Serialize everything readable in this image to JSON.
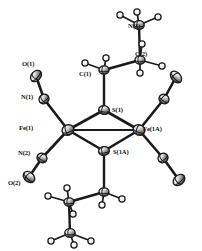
{
  "figure": {
    "kind": "ortep-thermal-ellipsoid-plot",
    "title": "",
    "background_color": "#ffffff",
    "line_color": "#1a1a1a",
    "ellipsoid_fill": "#d9d9d9",
    "ellipsoid_dark": "#3a3a3a",
    "hydrogen_fill": "#fbfbfb",
    "width": 202,
    "height": 251
  },
  "labels": [
    {
      "id": "label-n3",
      "text": "N(3)",
      "x": 128,
      "y": 28
    },
    {
      "id": "label-c2",
      "text": "C(2)",
      "x": 135,
      "y": 56
    },
    {
      "id": "label-c1",
      "text": "C(1)",
      "x": 79,
      "y": 76
    },
    {
      "id": "label-o1",
      "text": "O(1)",
      "x": 22,
      "y": 66
    },
    {
      "id": "label-n1",
      "text": "N(1)",
      "x": 21,
      "y": 99
    },
    {
      "id": "label-fe1",
      "text": "Fe(1)",
      "x": 19,
      "y": 130
    },
    {
      "id": "label-n2",
      "text": "N(2)",
      "x": 18,
      "y": 155
    },
    {
      "id": "label-o2",
      "text": "O(2)",
      "x": 8,
      "y": 185
    },
    {
      "id": "label-s1",
      "text": "S(1)",
      "x": 112,
      "y": 112
    },
    {
      "id": "label-s1a",
      "text": "S(1A)",
      "x": 113,
      "y": 154
    },
    {
      "id": "label-fe1a",
      "text": "Fe(1A)",
      "x": 143,
      "y": 131
    }
  ],
  "atoms": [
    {
      "id": "atom-fe1",
      "element": "Fe",
      "label": "Fe(1)",
      "x": 68,
      "y": 130,
      "rx": 6.0,
      "ry": 5.2,
      "rot": -18,
      "kind": "ellipsoid"
    },
    {
      "id": "atom-fe1a",
      "element": "Fe",
      "label": "Fe(1A)",
      "x": 139,
      "y": 130,
      "rx": 6.0,
      "ry": 5.2,
      "rot": 18,
      "kind": "ellipsoid"
    },
    {
      "id": "atom-s1",
      "element": "S",
      "label": "S(1)",
      "x": 104,
      "y": 110,
      "rx": 5.4,
      "ry": 4.4,
      "rot": 8,
      "kind": "ellipsoid"
    },
    {
      "id": "atom-s1a",
      "element": "S",
      "label": "S(1A)",
      "x": 104,
      "y": 151,
      "rx": 5.4,
      "ry": 4.4,
      "rot": -8,
      "kind": "ellipsoid"
    },
    {
      "id": "atom-n1",
      "element": "N",
      "label": "N(1)",
      "x": 44,
      "y": 99,
      "rx": 5.2,
      "ry": 4.6,
      "rot": -35,
      "kind": "ellipsoid"
    },
    {
      "id": "atom-o1",
      "element": "O",
      "label": "O(1)",
      "x": 36,
      "y": 76,
      "rx": 6.4,
      "ry": 4.6,
      "rot": -48,
      "kind": "ellipsoid"
    },
    {
      "id": "atom-n2",
      "element": "N",
      "label": "N(2)",
      "x": 42,
      "y": 158,
      "rx": 5.2,
      "ry": 4.6,
      "rot": 35,
      "kind": "ellipsoid"
    },
    {
      "id": "atom-o2",
      "element": "O",
      "label": "O(2)",
      "x": 29,
      "y": 177,
      "rx": 6.4,
      "ry": 4.8,
      "rot": 42,
      "kind": "ellipsoid"
    },
    {
      "id": "atom-n1a",
      "element": "N",
      "label": "",
      "x": 164,
      "y": 99,
      "rx": 5.2,
      "ry": 4.6,
      "rot": 35,
      "kind": "ellipsoid"
    },
    {
      "id": "atom-o1a",
      "element": "O",
      "label": "",
      "x": 176,
      "y": 77,
      "rx": 6.6,
      "ry": 4.6,
      "rot": 48,
      "kind": "ellipsoid"
    },
    {
      "id": "atom-n2a",
      "element": "N",
      "label": "",
      "x": 163,
      "y": 158,
      "rx": 5.2,
      "ry": 4.6,
      "rot": -35,
      "kind": "ellipsoid"
    },
    {
      "id": "atom-o2a",
      "element": "O",
      "label": "",
      "x": 179,
      "y": 180,
      "rx": 6.6,
      "ry": 4.8,
      "rot": -42,
      "kind": "ellipsoid"
    },
    {
      "id": "atom-c1",
      "element": "C",
      "label": "C(1)",
      "x": 104,
      "y": 70,
      "rx": 5.0,
      "ry": 4.2,
      "rot": 0,
      "kind": "ellipsoid"
    },
    {
      "id": "atom-c2",
      "element": "C",
      "label": "C(2)",
      "x": 140,
      "y": 60,
      "rx": 5.0,
      "ry": 4.2,
      "rot": 0,
      "kind": "ellipsoid"
    },
    {
      "id": "atom-n3",
      "element": "N",
      "label": "N(3)",
      "x": 139,
      "y": 25,
      "rx": 5.2,
      "ry": 4.4,
      "rot": 0,
      "kind": "ellipsoid"
    },
    {
      "id": "atom-c1a",
      "element": "C",
      "label": "",
      "x": 104,
      "y": 192,
      "rx": 5.0,
      "ry": 4.2,
      "rot": 0,
      "kind": "ellipsoid"
    },
    {
      "id": "atom-c2a",
      "element": "C",
      "label": "",
      "x": 69,
      "y": 202,
      "rx": 5.0,
      "ry": 4.2,
      "rot": 0,
      "kind": "ellipsoid"
    },
    {
      "id": "atom-n3a",
      "element": "N",
      "label": "",
      "x": 70,
      "y": 233,
      "rx": 5.2,
      "ry": 4.4,
      "rot": 0,
      "kind": "ellipsoid"
    }
  ],
  "hydrogens": [
    {
      "id": "h-n3-a",
      "x": 120,
      "y": 15,
      "r": 3.1
    },
    {
      "id": "h-n3-b",
      "x": 137,
      "y": 12,
      "r": 3.1
    },
    {
      "id": "h-n3-c",
      "x": 158,
      "y": 17,
      "r": 3.1
    },
    {
      "id": "h-c2-a",
      "x": 142,
      "y": 44,
      "r": 3.1
    },
    {
      "id": "h-c2-b",
      "x": 162,
      "y": 66,
      "r": 3.1
    },
    {
      "id": "h-c2-c",
      "x": 140,
      "y": 73,
      "r": 3.1
    },
    {
      "id": "h-c1-a",
      "x": 85,
      "y": 63,
      "r": 3.1
    },
    {
      "id": "h-c1-b",
      "x": 106,
      "y": 58,
      "r": 3.1
    },
    {
      "id": "h-c1a-a",
      "x": 122,
      "y": 199,
      "r": 3.1
    },
    {
      "id": "h-c1a-b",
      "x": 102,
      "y": 205,
      "r": 3.1
    },
    {
      "id": "h-c2a-a",
      "x": 67,
      "y": 188,
      "r": 3.1
    },
    {
      "id": "h-c2a-b",
      "x": 48,
      "y": 196,
      "r": 3.1
    },
    {
      "id": "h-c2a-c",
      "x": 73,
      "y": 214,
      "r": 3.1
    },
    {
      "id": "h-n3a-a",
      "x": 51,
      "y": 241,
      "r": 3.1
    },
    {
      "id": "h-n3a-b",
      "x": 74,
      "y": 245,
      "r": 3.1
    },
    {
      "id": "h-n3a-c",
      "x": 91,
      "y": 241,
      "r": 3.1
    }
  ],
  "bonds": [
    {
      "id": "bond-fe1-s1",
      "from": "atom-fe1",
      "to": "atom-s1",
      "width": 2.6
    },
    {
      "id": "bond-fe1-s1a",
      "from": "atom-fe1",
      "to": "atom-s1a",
      "width": 2.6
    },
    {
      "id": "bond-fe1a-s1",
      "from": "atom-fe1a",
      "to": "atom-s1",
      "width": 2.6
    },
    {
      "id": "bond-fe1a-s1a",
      "from": "atom-fe1a",
      "to": "atom-s1a",
      "width": 2.6
    },
    {
      "id": "bond-fe1-fe1a",
      "from": "atom-fe1",
      "to": "atom-fe1a",
      "width": 1.9
    },
    {
      "id": "bond-fe1-n1",
      "from": "atom-fe1",
      "to": "atom-n1",
      "width": 2.6
    },
    {
      "id": "bond-n1-o1",
      "from": "atom-n1",
      "to": "atom-o1",
      "width": 2.6
    },
    {
      "id": "bond-fe1-n2",
      "from": "atom-fe1",
      "to": "atom-n2",
      "width": 2.6
    },
    {
      "id": "bond-n2-o2",
      "from": "atom-n2",
      "to": "atom-o2",
      "width": 2.6
    },
    {
      "id": "bond-fe1a-n1a",
      "from": "atom-fe1a",
      "to": "atom-n1a",
      "width": 2.6
    },
    {
      "id": "bond-n1a-o1a",
      "from": "atom-n1a",
      "to": "atom-o1a",
      "width": 2.6
    },
    {
      "id": "bond-fe1a-n2a",
      "from": "atom-fe1a",
      "to": "atom-n2a",
      "width": 2.6
    },
    {
      "id": "bond-n2a-o2a",
      "from": "atom-n2a",
      "to": "atom-o2a",
      "width": 2.6
    },
    {
      "id": "bond-s1-c1",
      "from": "atom-s1",
      "to": "atom-c1",
      "width": 2.4
    },
    {
      "id": "bond-c1-c2",
      "from": "atom-c1",
      "to": "atom-c2",
      "width": 2.4
    },
    {
      "id": "bond-c2-n3",
      "from": "atom-c2",
      "to": "atom-n3",
      "width": 2.4
    },
    {
      "id": "bond-s1a-c1a",
      "from": "atom-s1a",
      "to": "atom-c1a",
      "width": 2.4
    },
    {
      "id": "bond-c1a-c2a",
      "from": "atom-c1a",
      "to": "atom-c2a",
      "width": 2.4
    },
    {
      "id": "bond-c2a-n3a",
      "from": "atom-c2a",
      "to": "atom-n3a",
      "width": 2.4
    }
  ],
  "h_bonds": [
    {
      "id": "hb-n3-a",
      "from": "atom-n3",
      "to": "h-n3-a"
    },
    {
      "id": "hb-n3-b",
      "from": "atom-n3",
      "to": "h-n3-b"
    },
    {
      "id": "hb-n3-c",
      "from": "atom-n3",
      "to": "h-n3-c"
    },
    {
      "id": "hb-c2-a",
      "from": "atom-c2",
      "to": "h-c2-a"
    },
    {
      "id": "hb-c2-b",
      "from": "atom-c2",
      "to": "h-c2-b"
    },
    {
      "id": "hb-c2-c",
      "from": "atom-c2",
      "to": "h-c2-c"
    },
    {
      "id": "hb-c1-a",
      "from": "atom-c1",
      "to": "h-c1-a"
    },
    {
      "id": "hb-c1-b",
      "from": "atom-c1",
      "to": "h-c1-b"
    },
    {
      "id": "hb-c1a-a",
      "from": "atom-c1a",
      "to": "h-c1a-a"
    },
    {
      "id": "hb-c1a-b",
      "from": "atom-c1a",
      "to": "h-c1a-b"
    },
    {
      "id": "hb-c2a-a",
      "from": "atom-c2a",
      "to": "h-c2a-a"
    },
    {
      "id": "hb-c2a-b",
      "from": "atom-c2a",
      "to": "h-c2a-b"
    },
    {
      "id": "hb-c2a-c",
      "from": "atom-c2a",
      "to": "h-c2a-c"
    },
    {
      "id": "hb-n3a-a",
      "from": "atom-n3a",
      "to": "h-n3a-a"
    },
    {
      "id": "hb-n3a-b",
      "from": "atom-n3a",
      "to": "h-n3a-b"
    },
    {
      "id": "hb-n3a-c",
      "from": "atom-n3a",
      "to": "h-n3a-c"
    }
  ]
}
